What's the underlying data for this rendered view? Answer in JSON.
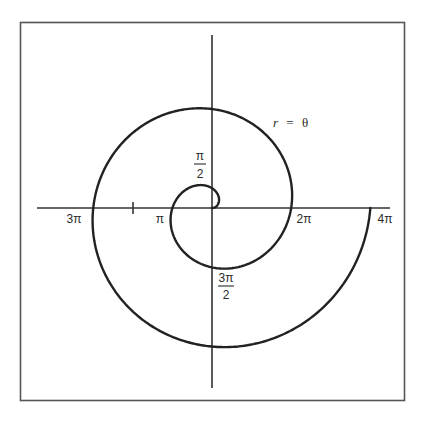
{
  "chart_data": {
    "type": "line",
    "subtype": "polar",
    "title": "",
    "equation_label": "r = θ",
    "equation": {
      "r_symbol": "r",
      "equals": "=",
      "theta_symbol": "θ"
    },
    "theta_range": [
      0,
      12.566
    ],
    "theta_range_label": "0 to 4π",
    "series": [
      {
        "name": "r = θ (Archimedean spiral)",
        "points_polar": [
          {
            "theta": 0,
            "r": 0
          },
          {
            "theta": 1.5708,
            "r": 1.5708,
            "label": "π/2"
          },
          {
            "theta": 3.1416,
            "r": 3.1416,
            "label": "π"
          },
          {
            "theta": 4.7124,
            "r": 4.7124,
            "label": "3π/2"
          },
          {
            "theta": 6.2832,
            "r": 6.2832,
            "label": "2π"
          },
          {
            "theta": 7.854,
            "r": 7.854
          },
          {
            "theta": 9.4248,
            "r": 9.4248,
            "label": "3π"
          },
          {
            "theta": 10.9956,
            "r": 10.9956
          },
          {
            "theta": 12.5664,
            "r": 12.5664,
            "label": "4π"
          }
        ]
      }
    ],
    "axis_labels": {
      "x_positive": [
        "2π",
        "4π"
      ],
      "x_negative": [
        "π",
        "3π"
      ],
      "y_positive": [
        "π/2"
      ],
      "y_negative": [
        "3π/2"
      ]
    },
    "tick_marks": [
      "2π (negative x-axis)"
    ],
    "grid": false,
    "legend": "none",
    "frame": true
  },
  "labels": {
    "r": "r",
    "eq": "=",
    "theta": "θ",
    "pi_half_num": "π",
    "pi_half_den": "2",
    "three_pi_half_num": "3π",
    "three_pi_half_den": "2",
    "pi": "π",
    "two_pi": "2π",
    "three_pi": "3π",
    "four_pi": "4π"
  }
}
